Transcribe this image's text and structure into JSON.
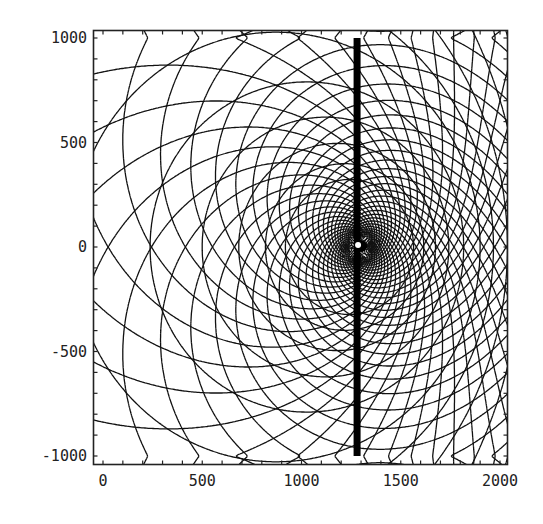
{
  "chart_data": {
    "type": "line",
    "title": "",
    "xlabel": "",
    "ylabel": "",
    "xlim": [
      -30,
      2060
    ],
    "ylim": [
      -1080,
      1060
    ],
    "grid": false,
    "legend": "none",
    "x_ticks": [
      {
        "value": 0,
        "label": "0"
      },
      {
        "value": 500,
        "label": "500"
      },
      {
        "value": 1000,
        "label": "1000"
      },
      {
        "value": 1500,
        "label": "1500"
      },
      {
        "value": 2000,
        "label": "2000"
      }
    ],
    "y_ticks": [
      {
        "value": 1000,
        "label": "1000"
      },
      {
        "value": 500,
        "label": "500"
      },
      {
        "value": 0,
        "label": "0"
      },
      {
        "value": -500,
        "label": "-500"
      },
      {
        "value": -1000,
        "label": "-1000"
      }
    ],
    "minor_tick_step_x": 100,
    "minor_tick_step_y": 100,
    "series": [
      {
        "name": "mesh-lines",
        "description": "Curvilinear mesh around a focal point: nested equipotential circles plus two oblique families of spiral lines reflecting off the top and bottom boundaries",
        "focus": [
          1290,
          0
        ],
        "second_focus": [
          3400,
          0
        ],
        "circle_levels": [
          -1.9,
          -1.7,
          -1.5,
          -1.3,
          -1.1,
          -0.9,
          -0.75,
          -0.6,
          -0.45,
          -0.3,
          -0.15,
          0.0,
          0.15,
          0.3,
          0.45,
          0.6,
          0.75,
          0.9,
          1.05,
          1.2,
          1.35,
          1.5,
          1.65
        ],
        "spiral_pitch": 1.6,
        "spiral_count": 16
      },
      {
        "name": "vertical-bar",
        "description": "Thick vertical bar",
        "x": 1280,
        "y_range": [
          -1000,
          1000
        ]
      }
    ],
    "annotations": []
  }
}
